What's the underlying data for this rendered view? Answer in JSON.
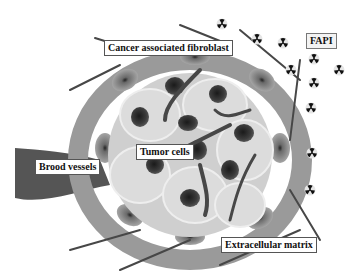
{
  "diagram": {
    "labels": {
      "caf": "Cancer associated fibroblast",
      "fapi": "FAPI",
      "tumor": "Tumor cells",
      "vessels": "Brood vessels",
      "ecm": "Extracellular matrix"
    },
    "icons": {
      "fapi_tracer": "radiation-icon"
    },
    "colors": {
      "tumor_cell_fill": "#d6d6d6",
      "nucleus": "#3a3a3a",
      "fibroblast": "#8a8a8a",
      "matrix_fiber": "#4a4a4a",
      "vessel": "#555555"
    }
  }
}
